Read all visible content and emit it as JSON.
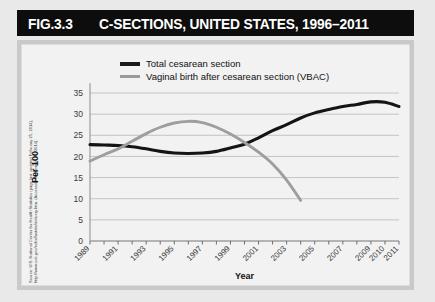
{
  "figure": {
    "number": "FIG.3.3",
    "title": "C-SECTIONS, UNITED STATES, 1996–2011",
    "source": "Source: U.S. National Center for Health Statistics (page last updated February 25, 2014), http://www.cdc.gov/nchs/fastats/delivery.htm. (Accessed September 16, 2014)."
  },
  "chart_data": {
    "type": "line",
    "title": "C-SECTIONS, UNITED STATES, 1996–2011",
    "xlabel": "Year",
    "ylabel": "Per 100",
    "ylim": [
      0,
      35
    ],
    "yticks": [
      0,
      5,
      10,
      15,
      20,
      25,
      30,
      35
    ],
    "xlim": [
      1989,
      2011
    ],
    "xtick_labels": [
      "1989",
      "1991",
      "1993",
      "1995",
      "1997",
      "1999",
      "2001",
      "2003",
      "2005",
      "2007",
      "2009",
      "2010",
      "2011"
    ],
    "xtick_values": [
      1989,
      1991,
      1993,
      1995,
      1997,
      1999,
      2001,
      2003,
      2005,
      2007,
      2009,
      2010,
      2011
    ],
    "grid": "horizontal",
    "legend_position": "top-left",
    "series": [
      {
        "name": "Total cesarean section",
        "color": "#141414",
        "x": [
          1989,
          1990,
          1991,
          1992,
          1993,
          1994,
          1995,
          1996,
          1997,
          1998,
          1999,
          2000,
          2001,
          2002,
          2003,
          2004,
          2005,
          2006,
          2007,
          2008,
          2009,
          2010,
          2011
        ],
        "values": [
          22.8,
          22.7,
          22.6,
          22.3,
          21.8,
          21.2,
          20.8,
          20.7,
          20.8,
          21.2,
          22.0,
          22.9,
          24.4,
          26.1,
          27.5,
          29.1,
          30.3,
          31.1,
          31.8,
          32.3,
          32.9,
          32.8,
          31.8
        ]
      },
      {
        "name": "Vaginal birth after cesarean section (VBAC)",
        "color": "#9e9e9e",
        "x": [
          1989,
          1990,
          1991,
          1992,
          1993,
          1994,
          1995,
          1996,
          1997,
          1998,
          1999,
          2000,
          2001,
          2002,
          2003,
          2004
        ],
        "values": [
          18.9,
          20.4,
          21.8,
          23.6,
          25.4,
          26.9,
          27.9,
          28.3,
          28.0,
          26.9,
          25.3,
          23.3,
          21.0,
          18.2,
          14.4,
          9.6
        ]
      }
    ]
  },
  "axes": {
    "y_title": "Per 100",
    "x_title": "Year"
  },
  "legend": {
    "items": [
      {
        "label": "Total cesarean section",
        "color": "#141414"
      },
      {
        "label": "Vaginal birth after cesarean section (VBAC)",
        "color": "#9e9e9e"
      }
    ]
  }
}
